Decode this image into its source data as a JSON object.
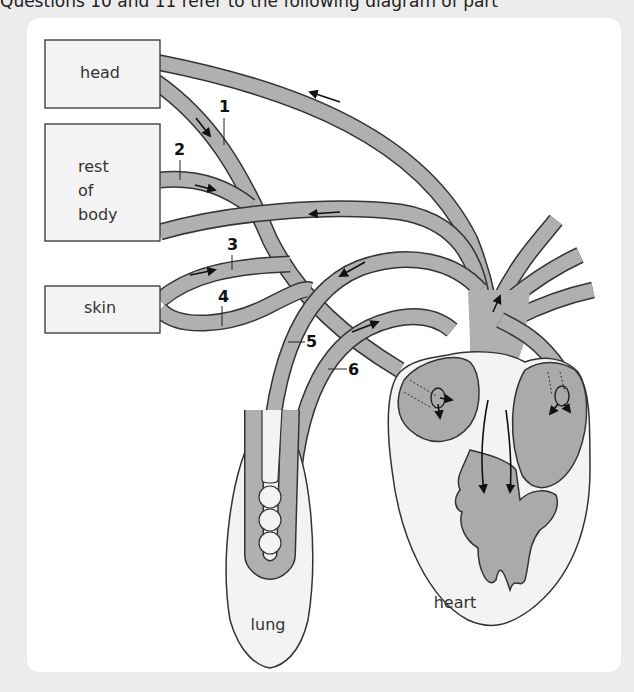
{
  "caption": "Questions 10 and 11 refer to the following diagram of part",
  "colors": {
    "background": "#ececec",
    "panel": "#ffffff",
    "vessel_fill": "#b0b0b0",
    "organ_fill": "#f3f3f3",
    "chamber_fill": "#a9a9a9",
    "outline": "#333333"
  },
  "diagram": {
    "boxes": [
      {
        "id": "head",
        "label": "head"
      },
      {
        "id": "rest-of-body",
        "label_lines": [
          "rest",
          "of",
          "body"
        ]
      },
      {
        "id": "skin",
        "label": "skin"
      }
    ],
    "organs": [
      {
        "id": "lung",
        "label": "lung"
      },
      {
        "id": "heart",
        "label": "heart"
      }
    ],
    "vessel_labels": [
      "1",
      "2",
      "3",
      "4",
      "5",
      "6"
    ]
  }
}
